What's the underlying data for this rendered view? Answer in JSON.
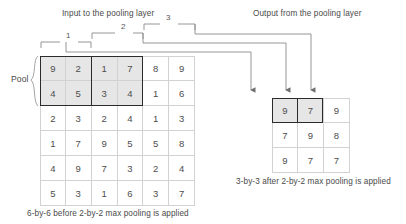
{
  "headers": {
    "input_title": "Input to the pooling layer",
    "output_title": "Output from the pooling layer"
  },
  "captions": {
    "input_caption": "6-by-6 before 2-by-2 max pooling is applied",
    "output_caption": "3-by-3 after 2-by-2 max pooling is applied"
  },
  "pool_label": "Pool",
  "window_labels": [
    "1",
    "2",
    "3"
  ],
  "colors": {
    "shaded_cell": "#e6e6e6",
    "grid_line": "#d2d2d2",
    "emphasis_border": "#2b2b2b",
    "wire": "#8a8a8a",
    "text": "#4a4a4a"
  },
  "chart_data": {
    "type": "table",
    "title": "2-by-2 max pooling",
    "input": {
      "rows": 6,
      "cols": 6,
      "values": [
        [
          9,
          2,
          1,
          7,
          8,
          9
        ],
        [
          4,
          5,
          3,
          4,
          1,
          6
        ],
        [
          2,
          3,
          2,
          4,
          1,
          3
        ],
        [
          1,
          7,
          9,
          5,
          5,
          8
        ],
        [
          4,
          9,
          7,
          3,
          2,
          4
        ],
        [
          5,
          3,
          1,
          6,
          3,
          7
        ]
      ],
      "shaded_cells": [
        [
          0,
          0
        ],
        [
          0,
          1
        ],
        [
          0,
          2
        ],
        [
          0,
          3
        ],
        [
          1,
          0
        ],
        [
          1,
          1
        ],
        [
          1,
          2
        ],
        [
          1,
          3
        ]
      ]
    },
    "output": {
      "rows": 3,
      "cols": 3,
      "values": [
        [
          9,
          7,
          9
        ],
        [
          7,
          9,
          8
        ],
        [
          9,
          7,
          7
        ]
      ],
      "shaded_cells": [
        [
          0,
          0
        ],
        [
          0,
          1
        ]
      ]
    }
  },
  "input_flat": [
    "9",
    "2",
    "1",
    "7",
    "8",
    "9",
    "4",
    "5",
    "3",
    "4",
    "1",
    "6",
    "2",
    "3",
    "2",
    "4",
    "1",
    "3",
    "1",
    "7",
    "9",
    "5",
    "5",
    "8",
    "4",
    "9",
    "7",
    "3",
    "2",
    "4",
    "5",
    "3",
    "1",
    "6",
    "3",
    "7"
  ],
  "output_flat": [
    "9",
    "7",
    "9",
    "7",
    "9",
    "8",
    "9",
    "7",
    "7"
  ]
}
